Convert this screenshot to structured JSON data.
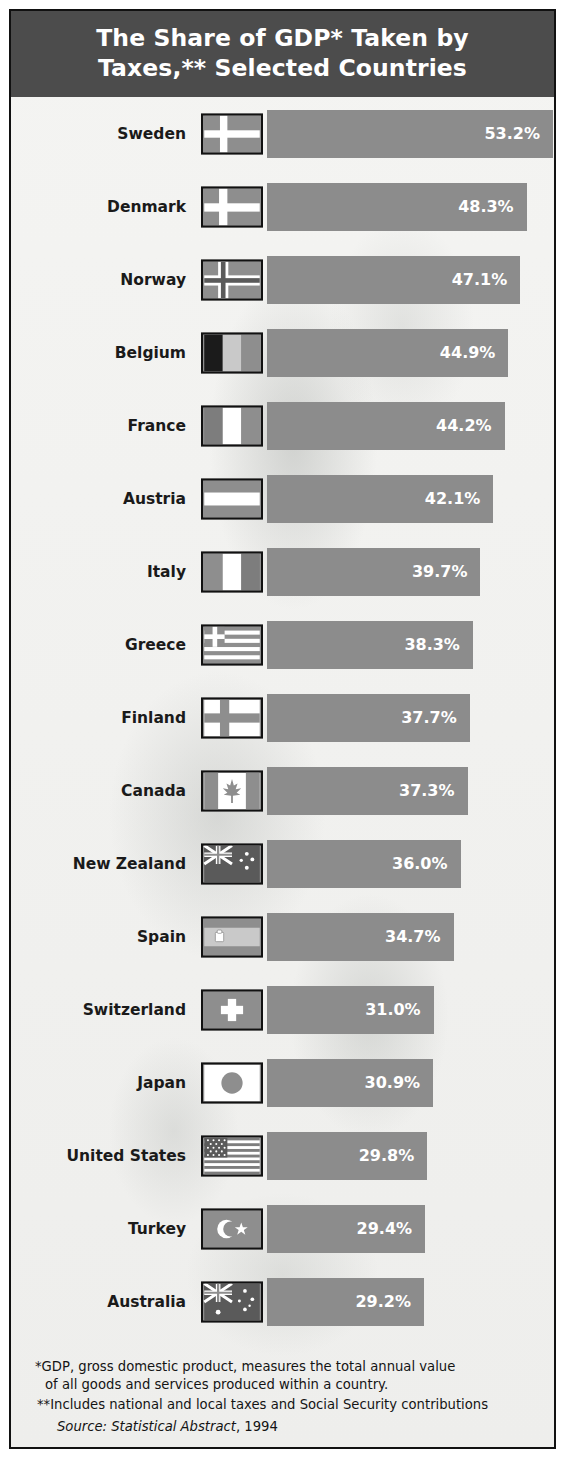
{
  "header": {
    "title_line1": "The Share of GDP* Taken by",
    "title_line2": "Taxes,** Selected Countries"
  },
  "notes": {
    "footnote1_line1": "*GDP, gross domestic product, measures the total annual value",
    "footnote1_line2": "of all goods and services produced within a country.",
    "footnote2": "**Includes national and local taxes and Social Security contributions",
    "source_label": "Source: Statistical Abstract",
    "source_year": ", 1994"
  },
  "colors": {
    "header_bg": "#4c4c4c",
    "bar": "#8c8c8c",
    "bar_label": "#ffffff",
    "page_bg": "#f2f2f0",
    "border": "#111111"
  },
  "chart_data": {
    "type": "bar",
    "title": "The Share of GDP* Taken by Taxes,** Selected Countries",
    "xlabel": "",
    "ylabel": "",
    "orientation": "horizontal",
    "grid": false,
    "legend": "none",
    "xlim": [
      0,
      53.2
    ],
    "unit": "%",
    "categories": [
      "Sweden",
      "Denmark",
      "Norway",
      "Belgium",
      "France",
      "Austria",
      "Italy",
      "Greece",
      "Finland",
      "Canada",
      "New Zealand",
      "Spain",
      "Switzerland",
      "Japan",
      "United States",
      "Turkey",
      "Australia"
    ],
    "values": [
      53.2,
      48.3,
      47.1,
      44.9,
      44.2,
      42.1,
      39.7,
      38.3,
      37.7,
      37.3,
      36.0,
      34.7,
      31.0,
      30.9,
      29.8,
      29.4,
      29.2
    ],
    "labels": [
      "53.2%",
      "48.3%",
      "47.1%",
      "44.9%",
      "44.2%",
      "42.1%",
      "39.7%",
      "38.3%",
      "37.7%",
      "37.3%",
      "36.0%",
      "34.7%",
      "31.0%",
      "30.9%",
      "29.8%",
      "29.4%",
      "29.2%"
    ],
    "rows": [
      {
        "country": "Sweden",
        "value": 53.2,
        "label": "53.2%",
        "flag": "sweden-flag"
      },
      {
        "country": "Denmark",
        "value": 48.3,
        "label": "48.3%",
        "flag": "denmark-flag"
      },
      {
        "country": "Norway",
        "value": 47.1,
        "label": "47.1%",
        "flag": "norway-flag"
      },
      {
        "country": "Belgium",
        "value": 44.9,
        "label": "44.9%",
        "flag": "belgium-flag"
      },
      {
        "country": "France",
        "value": 44.2,
        "label": "44.2%",
        "flag": "france-flag"
      },
      {
        "country": "Austria",
        "value": 42.1,
        "label": "42.1%",
        "flag": "austria-flag"
      },
      {
        "country": "Italy",
        "value": 39.7,
        "label": "39.7%",
        "flag": "italy-flag"
      },
      {
        "country": "Greece",
        "value": 38.3,
        "label": "38.3%",
        "flag": "greece-flag"
      },
      {
        "country": "Finland",
        "value": 37.7,
        "label": "37.7%",
        "flag": "finland-flag"
      },
      {
        "country": "Canada",
        "value": 37.3,
        "label": "37.3%",
        "flag": "canada-flag"
      },
      {
        "country": "New Zealand",
        "value": 36.0,
        "label": "36.0%",
        "flag": "new-zealand-flag"
      },
      {
        "country": "Spain",
        "value": 34.7,
        "label": "34.7%",
        "flag": "spain-flag"
      },
      {
        "country": "Switzerland",
        "value": 31.0,
        "label": "31.0%",
        "flag": "switzerland-flag"
      },
      {
        "country": "Japan",
        "value": 30.9,
        "label": "30.9%",
        "flag": "japan-flag"
      },
      {
        "country": "United States",
        "value": 29.8,
        "label": "29.8%",
        "flag": "united-states-flag"
      },
      {
        "country": "Turkey",
        "value": 29.4,
        "label": "29.4%",
        "flag": "turkey-flag"
      },
      {
        "country": "Australia",
        "value": 29.2,
        "label": "29.2%",
        "flag": "australia-flag"
      }
    ]
  }
}
